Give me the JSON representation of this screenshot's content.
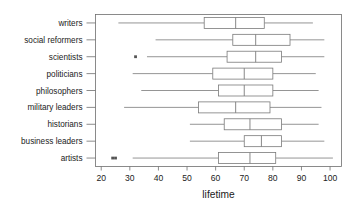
{
  "chart_data": {
    "type": "box",
    "title": "",
    "subtitle": "",
    "xlabel": "lifetime",
    "ylabel": "",
    "orientation": "horizontal",
    "grid": false,
    "legend": null,
    "xlim": [
      18,
      104
    ],
    "xticks": [
      20,
      30,
      40,
      50,
      60,
      70,
      80,
      90,
      100
    ],
    "xtick_labels": [
      "20",
      "30",
      "40",
      "50",
      "60",
      "70",
      "80",
      "90",
      "100"
    ],
    "categories": [
      "writers",
      "social reformers",
      "scientists",
      "politicians",
      "philosophers",
      "military leaders",
      "historians",
      "business leaders",
      "artists"
    ],
    "boxes": [
      {
        "category": "writers",
        "whisker_low": 26,
        "q1": 56,
        "median": 67,
        "q3": 77,
        "whisker_high": 94,
        "outliers": []
      },
      {
        "category": "social reformers",
        "whisker_low": 39,
        "q1": 66,
        "median": 74,
        "q3": 86,
        "whisker_high": 98,
        "outliers": []
      },
      {
        "category": "scientists",
        "whisker_low": 36,
        "q1": 64,
        "median": 74,
        "q3": 83,
        "whisker_high": 98,
        "outliers": [
          32
        ]
      },
      {
        "category": "politicians",
        "whisker_low": 31,
        "q1": 59,
        "median": 70,
        "q3": 80,
        "whisker_high": 95,
        "outliers": []
      },
      {
        "category": "philosophers",
        "whisker_low": 34,
        "q1": 61,
        "median": 70,
        "q3": 80,
        "whisker_high": 96,
        "outliers": []
      },
      {
        "category": "military leaders",
        "whisker_low": 28,
        "q1": 54,
        "median": 67,
        "q3": 79,
        "whisker_high": 97,
        "outliers": []
      },
      {
        "category": "historians",
        "whisker_low": 51,
        "q1": 63,
        "median": 72,
        "q3": 83,
        "whisker_high": 96,
        "outliers": []
      },
      {
        "category": "business leaders",
        "whisker_low": 51,
        "q1": 70,
        "median": 76,
        "q3": 83,
        "whisker_high": 98,
        "outliers": []
      },
      {
        "category": "artists",
        "whisker_low": 31,
        "q1": 61,
        "median": 72,
        "q3": 81,
        "whisker_high": 101,
        "outliers": [
          24,
          25
        ]
      }
    ]
  }
}
